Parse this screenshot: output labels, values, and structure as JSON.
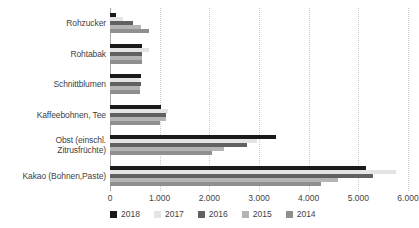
{
  "chart_data": {
    "type": "bar",
    "orientation": "horizontal",
    "title": "",
    "xlabel": "",
    "ylabel": "",
    "xlim": [
      0,
      6000
    ],
    "xticks": [
      0,
      1000,
      2000,
      3000,
      4000,
      5000,
      6000
    ],
    "xtick_labels": [
      "0",
      "1.000",
      "2.000",
      "3.000",
      "4.000",
      "5.000",
      "6.000"
    ],
    "grid": true,
    "grid_axis": "x",
    "legend_position": "bottom",
    "categories": [
      "Rohzucker",
      "Rohtabak",
      "Schnittblumen",
      "Kaffeebohnen, Tee",
      "Obst (einschl. Zitrusfrüchte)",
      "Kakao (Bohnen,Paste)"
    ],
    "category_lines": [
      [
        "Rohzucker"
      ],
      [
        "Rohtabak"
      ],
      [
        "Schnittblumen"
      ],
      [
        "Kaffeebohnen, Tee"
      ],
      [
        "Obst (einschl.",
        "Zitrusfrüchte)"
      ],
      [
        "Kakao (Bohnen,Paste)"
      ]
    ],
    "series": [
      {
        "name": "2018",
        "color": "#1a1a1a",
        "values": [
          120,
          650,
          620,
          1020,
          3350,
          5150
        ]
      },
      {
        "name": "2017",
        "color": "#e4e4e4",
        "values": [
          270,
          780,
          600,
          1160,
          2960,
          5750
        ]
      },
      {
        "name": "2016",
        "color": "#616161",
        "values": [
          470,
          640,
          620,
          1130,
          2750,
          5300
        ]
      },
      {
        "name": "2015",
        "color": "#b4b4b4",
        "values": [
          620,
          650,
          600,
          1120,
          2300,
          4600
        ]
      },
      {
        "name": "2014",
        "color": "#8f8f8f",
        "values": [
          790,
          650,
          610,
          1000,
          2050,
          4250
        ]
      }
    ]
  },
  "legend": {
    "items": [
      {
        "label": "2018",
        "color": "#1a1a1a"
      },
      {
        "label": "2017",
        "color": "#e4e4e4"
      },
      {
        "label": "2016",
        "color": "#616161"
      },
      {
        "label": "2015",
        "color": "#b4b4b4"
      },
      {
        "label": "2014",
        "color": "#8f8f8f"
      }
    ]
  },
  "colors": {
    "background": "#ffffff",
    "text": "#3f3f3f",
    "gridline": "#c9c9c9",
    "axis": "#a6a6a6"
  }
}
